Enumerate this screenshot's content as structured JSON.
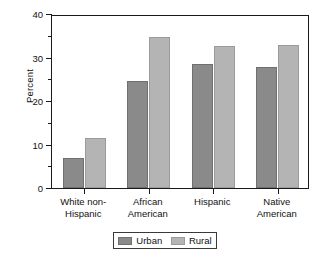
{
  "chart_data": {
    "type": "bar",
    "title": "",
    "subtitle": "",
    "xlabel": "",
    "ylabel": "Percent",
    "categories": [
      "White non-Hispanic",
      "African American",
      "Hispanic",
      "Native American"
    ],
    "category_lines": [
      [
        "White non-",
        "Hispanic"
      ],
      [
        "African",
        "American"
      ],
      [
        "Hispanic"
      ],
      [
        "Native",
        "American"
      ]
    ],
    "series": [
      {
        "name": "Urban",
        "color": "#8a8a8a",
        "values": [
          6.9,
          24.5,
          28.5,
          27.9
        ]
      },
      {
        "name": "Rural",
        "color": "#b4b4b4",
        "values": [
          11.4,
          34.7,
          32.6,
          32.9
        ]
      }
    ],
    "ylim": [
      0,
      40
    ],
    "ytick_labels": [
      "0",
      "10",
      "20",
      "30",
      "40"
    ],
    "ytick_values": [
      0,
      10,
      20,
      30,
      40
    ],
    "ytick_minor_values": [
      5,
      15,
      25,
      35
    ],
    "grid": false,
    "legend_position": "bottom-center",
    "annotations": []
  },
  "legend": {
    "items": [
      {
        "label": "Urban",
        "color": "#8a8a8a"
      },
      {
        "label": "Rural",
        "color": "#b4b4b4"
      }
    ]
  },
  "axis": {
    "y_title": "Percent"
  }
}
